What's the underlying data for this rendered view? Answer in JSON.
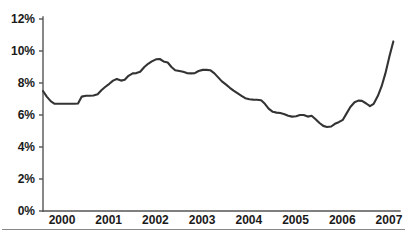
{
  "chart_data": {
    "type": "line",
    "title": "",
    "subtitle": "",
    "xlabel": "",
    "ylabel": "",
    "xlim": [
      2000.0,
      2007.6
    ],
    "ylim": [
      0,
      12
    ],
    "grid": false,
    "legend": null,
    "legend_position": "none",
    "y_tick_labels": [
      "0%",
      "2%",
      "4%",
      "6%",
      "8%",
      "10%",
      "12%"
    ],
    "y_tick_values": [
      0,
      2,
      4,
      6,
      8,
      10,
      12
    ],
    "x_tick_labels": [
      "2000",
      "2001",
      "2002",
      "2003",
      "2004",
      "2005",
      "2006",
      "2007"
    ],
    "x_tick_values": [
      2000,
      2001,
      2002,
      2003,
      2004,
      2005,
      2006,
      2007
    ],
    "series": [
      {
        "name": "rate",
        "color": "#333333",
        "x": [
          2000.0,
          2000.08,
          2000.17,
          2000.25,
          2000.33,
          2000.42,
          2000.5,
          2000.58,
          2000.67,
          2000.75,
          2000.83,
          2000.92,
          2001.0,
          2001.08,
          2001.17,
          2001.25,
          2001.33,
          2001.42,
          2001.5,
          2001.58,
          2001.67,
          2001.75,
          2001.83,
          2001.92,
          2002.0,
          2002.08,
          2002.17,
          2002.25,
          2002.33,
          2002.42,
          2002.5,
          2002.58,
          2002.67,
          2002.75,
          2002.83,
          2002.92,
          2003.0,
          2003.08,
          2003.17,
          2003.25,
          2003.33,
          2003.42,
          2003.5,
          2003.58,
          2003.67,
          2003.75,
          2003.83,
          2003.92,
          2004.0,
          2004.08,
          2004.17,
          2004.25,
          2004.33,
          2004.42,
          2004.5,
          2004.58,
          2004.67,
          2004.75,
          2004.83,
          2004.92,
          2005.0,
          2005.08,
          2005.17,
          2005.25,
          2005.33,
          2005.42,
          2005.5,
          2005.58,
          2005.67,
          2005.75,
          2005.83,
          2005.92,
          2006.0,
          2006.08,
          2006.17,
          2006.25,
          2006.33,
          2006.42,
          2006.5,
          2006.58,
          2006.67,
          2006.75,
          2006.83,
          2006.92,
          2007.0,
          2007.08,
          2007.17,
          2007.25,
          2007.33,
          2007.42,
          2007.5
        ],
        "y": [
          7.5,
          7.15,
          6.85,
          6.7,
          6.7,
          6.7,
          6.7,
          6.7,
          6.7,
          6.72,
          7.15,
          7.2,
          7.2,
          7.22,
          7.3,
          7.55,
          7.75,
          7.95,
          8.15,
          8.25,
          8.15,
          8.2,
          8.45,
          8.6,
          8.62,
          8.7,
          9.0,
          9.2,
          9.35,
          9.48,
          9.5,
          9.35,
          9.28,
          9.0,
          8.8,
          8.75,
          8.7,
          8.62,
          8.6,
          8.62,
          8.75,
          8.82,
          8.82,
          8.8,
          8.6,
          8.35,
          8.1,
          7.9,
          7.7,
          7.52,
          7.35,
          7.2,
          7.05,
          6.98,
          6.96,
          6.95,
          6.92,
          6.7,
          6.4,
          6.2,
          6.15,
          6.12,
          6.05,
          5.95,
          5.9,
          5.92,
          6.0,
          6.0,
          5.9,
          5.95,
          5.75,
          5.5,
          5.32,
          5.25,
          5.28,
          5.45,
          5.55,
          5.7,
          6.1,
          6.5,
          6.8,
          6.9,
          6.88,
          6.72,
          6.55,
          6.7,
          7.2,
          7.8,
          8.6,
          9.7,
          10.6
        ]
      }
    ],
    "annotations": []
  },
  "axis": {
    "line_color": "#555555",
    "text_color": "#1a1a1a"
  },
  "footer": {
    "rule_color": "#888888"
  }
}
